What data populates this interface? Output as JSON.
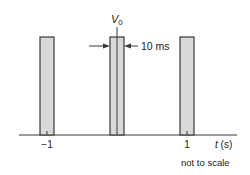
{
  "diagram": {
    "type": "pulse-train",
    "pulse_label": "V",
    "pulse_label_subscript": "0",
    "width_annotation": "10 ms",
    "x_axis_label_var": "t",
    "x_axis_label_unit": " (s)",
    "ticks": [
      {
        "value": "−1",
        "t": -1
      },
      {
        "value": "1",
        "t": 1
      }
    ],
    "footnote": "not to scale",
    "pulses": [
      {
        "center_t": -1,
        "height": "V0",
        "width": "10 ms"
      },
      {
        "center_t": 0,
        "height": "V0",
        "width": "10 ms"
      },
      {
        "center_t": 1,
        "height": "V0",
        "width": "10 ms"
      }
    ],
    "colors": {
      "pulse_fill": "#d9d9d9",
      "stroke": "#3a3a3a",
      "text": "#222222"
    }
  }
}
